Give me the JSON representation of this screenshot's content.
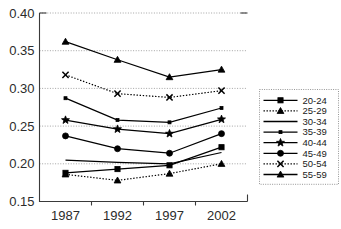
{
  "chart_data": {
    "type": "line",
    "title": "",
    "subtitle": "",
    "xlabel": "",
    "ylabel": "",
    "categories": [
      "1987",
      "1992",
      "1997",
      "2002"
    ],
    "ylim": [
      0.15,
      0.4
    ],
    "yticks": [
      "0.15",
      "0.20",
      "0.25",
      "0.30",
      "0.35",
      "0.40"
    ],
    "ytick_values": [
      0.15,
      0.2,
      0.25,
      0.3,
      0.35,
      0.4
    ],
    "grid": true,
    "grid_axis": "y",
    "legend_position": "right",
    "series": [
      {
        "name": "20-24",
        "marker": "square",
        "line_style": "solid",
        "values": [
          0.188,
          0.193,
          0.198,
          0.222
        ]
      },
      {
        "name": "25-29",
        "marker": "triangle",
        "line_style": "dotted",
        "values": [
          0.186,
          0.178,
          0.187,
          0.2
        ]
      },
      {
        "name": "30-34",
        "marker": "none",
        "line_style": "solid",
        "values": [
          0.205,
          0.202,
          0.2,
          0.215
        ]
      },
      {
        "name": "35-39",
        "marker": "dot",
        "line_style": "solid",
        "values": [
          0.287,
          0.258,
          0.255,
          0.274
        ]
      },
      {
        "name": "40-44",
        "marker": "star",
        "line_style": "solid",
        "values": [
          0.258,
          0.246,
          0.24,
          0.259
        ]
      },
      {
        "name": "45-49",
        "marker": "circle",
        "line_style": "solid",
        "values": [
          0.237,
          0.22,
          0.214,
          0.24
        ]
      },
      {
        "name": "50-54",
        "marker": "x",
        "line_style": "dotted",
        "values": [
          0.318,
          0.293,
          0.288,
          0.297
        ]
      },
      {
        "name": "55-59",
        "marker": "triangle",
        "line_style": "solid",
        "values": [
          0.362,
          0.338,
          0.315,
          0.325
        ]
      }
    ]
  },
  "colors": {
    "series": "#000000",
    "grid": "#9a9a9a",
    "axis": "#3a3a3a",
    "background": "#ffffff",
    "text": "#2b2b2b"
  }
}
